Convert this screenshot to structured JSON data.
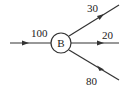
{
  "diagram": {
    "node": {
      "label": "B"
    },
    "edges": [
      {
        "id": "in",
        "direction": "incoming",
        "value": "100"
      },
      {
        "id": "out-top",
        "direction": "outgoing",
        "value": "30"
      },
      {
        "id": "out-middle",
        "direction": "outgoing",
        "value": "20"
      },
      {
        "id": "out-bottom",
        "direction": "outgoing",
        "value": "80"
      }
    ],
    "colors": {
      "stroke": "#333333",
      "text": "#222222"
    }
  }
}
